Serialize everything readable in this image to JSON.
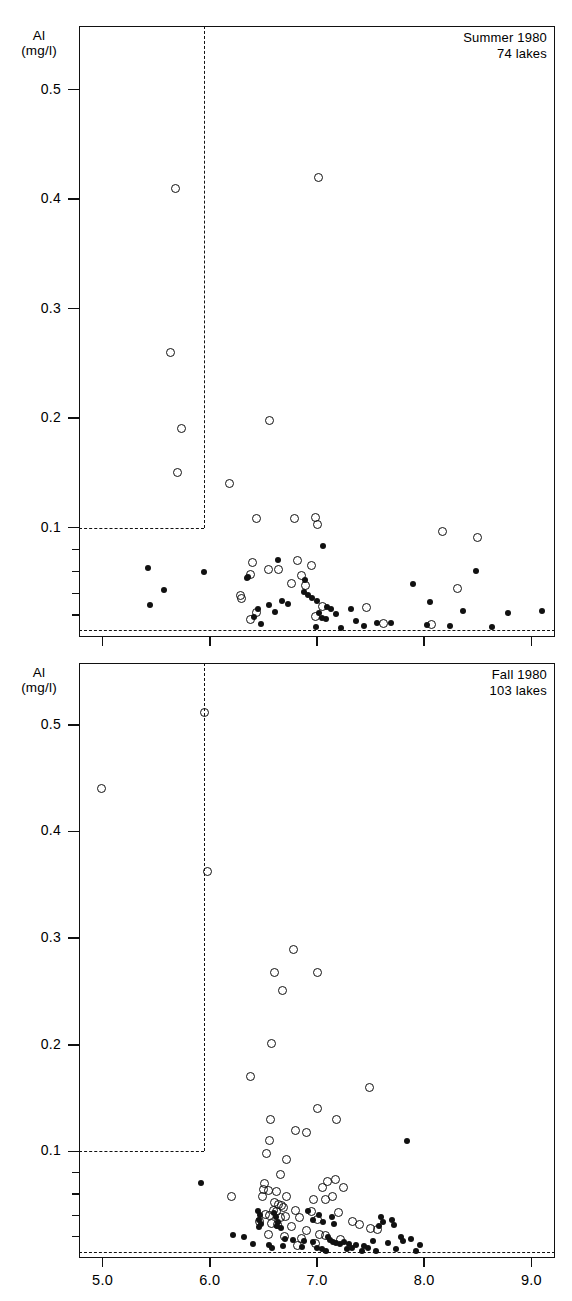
{
  "figure": {
    "background": "#ffffff",
    "ink_color": "#111111",
    "width": 572,
    "height": 1301
  },
  "chart_data": [
    {
      "type": "scatter",
      "title": "Summer 1980",
      "subtitle": "74 lakes",
      "panel_id": "summer",
      "xlabel": "",
      "ylabel": "Al",
      "ylabel_units": "(mg/l)",
      "xlim": [
        4.78,
        9.22
      ],
      "ylim": [
        0.0,
        0.558
      ],
      "xticks": [
        5.0,
        6.0,
        7.0,
        8.0,
        9.0
      ],
      "xticklabels": [
        "5.0",
        "6.0",
        "7.0",
        "8.0",
        "9.0"
      ],
      "xticklabels_visible": false,
      "yticks": [
        0.1,
        0.2,
        0.3,
        0.4,
        0.5
      ],
      "yticklabels": [
        "0.1",
        "0.2",
        "0.3",
        "0.4",
        "0.5"
      ],
      "yticks_minor": [
        0.02,
        0.04,
        0.06,
        0.08
      ],
      "grid": false,
      "legend": "none",
      "annotations": [
        {
          "name": "threshold-box",
          "style": "dashed",
          "x_vertical": 5.95,
          "y_horizontal": 0.1
        },
        {
          "name": "detection-limit-line",
          "style": "dashed",
          "y": 0.006
        }
      ],
      "series": [
        {
          "name": "open-circle",
          "marker": "open circle",
          "points": [
            [
              5.68,
              0.41
            ],
            [
              7.01,
              0.42
            ],
            [
              5.63,
              0.26
            ],
            [
              5.74,
              0.19
            ],
            [
              5.7,
              0.15
            ],
            [
              6.18,
              0.14
            ],
            [
              6.56,
              0.198
            ],
            [
              6.44,
              0.108
            ],
            [
              6.79,
              0.108
            ],
            [
              6.99,
              0.109
            ],
            [
              7.0,
              0.103
            ],
            [
              8.17,
              0.096
            ],
            [
              8.5,
              0.091
            ],
            [
              6.4,
              0.068
            ],
            [
              6.82,
              0.07
            ],
            [
              6.95,
              0.065
            ],
            [
              6.55,
              0.062
            ],
            [
              6.64,
              0.062
            ],
            [
              6.38,
              0.057
            ],
            [
              6.86,
              0.056
            ],
            [
              6.76,
              0.049
            ],
            [
              6.89,
              0.047
            ],
            [
              8.31,
              0.044
            ],
            [
              6.29,
              0.038
            ],
            [
              6.3,
              0.035
            ],
            [
              7.05,
              0.028
            ],
            [
              7.46,
              0.027
            ],
            [
              6.44,
              0.022
            ],
            [
              6.99,
              0.019
            ],
            [
              7.62,
              0.012
            ],
            [
              8.07,
              0.011
            ],
            [
              6.38,
              0.016
            ]
          ]
        },
        {
          "name": "filled-dot",
          "marker": "filled dot",
          "points": [
            [
              5.42,
              0.063
            ],
            [
              5.95,
              0.059
            ],
            [
              8.48,
              0.06
            ],
            [
              7.06,
              0.083
            ],
            [
              6.64,
              0.07
            ],
            [
              6.35,
              0.054
            ],
            [
              6.36,
              0.055
            ],
            [
              6.89,
              0.052
            ],
            [
              7.9,
              0.048
            ],
            [
              5.57,
              0.043
            ],
            [
              6.88,
              0.041
            ],
            [
              6.92,
              0.038
            ],
            [
              6.95,
              0.036
            ],
            [
              7.0,
              0.033
            ],
            [
              6.67,
              0.033
            ],
            [
              6.73,
              0.03
            ],
            [
              8.05,
              0.032
            ],
            [
              5.44,
              0.029
            ],
            [
              6.45,
              0.026
            ],
            [
              6.55,
              0.029
            ],
            [
              7.09,
              0.027
            ],
            [
              7.13,
              0.026
            ],
            [
              7.32,
              0.026
            ],
            [
              8.36,
              0.024
            ],
            [
              8.78,
              0.022
            ],
            [
              9.1,
              0.024
            ],
            [
              6.61,
              0.023
            ],
            [
              7.02,
              0.022
            ],
            [
              7.18,
              0.021
            ],
            [
              7.05,
              0.017
            ],
            [
              7.08,
              0.016
            ],
            [
              6.41,
              0.018
            ],
            [
              7.36,
              0.015
            ],
            [
              7.56,
              0.013
            ],
            [
              7.69,
              0.013
            ],
            [
              8.03,
              0.011
            ],
            [
              8.24,
              0.01
            ],
            [
              6.99,
              0.009
            ],
            [
              7.22,
              0.008
            ],
            [
              8.63,
              0.009
            ],
            [
              7.44,
              0.01
            ],
            [
              6.48,
              0.012
            ]
          ]
        }
      ]
    },
    {
      "type": "scatter",
      "title": "Fall 1980",
      "subtitle": "103 lakes",
      "panel_id": "fall",
      "xlabel": "",
      "ylabel": "Al",
      "ylabel_units": "(mg/l)",
      "xlim": [
        4.78,
        9.22
      ],
      "ylim": [
        0.0,
        0.558
      ],
      "xticks": [
        5.0,
        6.0,
        7.0,
        8.0,
        9.0
      ],
      "xticklabels": [
        "5.0",
        "6.0",
        "7.0",
        "8.0",
        "9.0"
      ],
      "xticklabels_visible": true,
      "yticks": [
        0.1,
        0.2,
        0.3,
        0.4,
        0.5
      ],
      "yticklabels": [
        "0.1",
        "0.2",
        "0.3",
        "0.4",
        "0.5"
      ],
      "yticks_minor": [
        0.02,
        0.04,
        0.06,
        0.08
      ],
      "grid": false,
      "legend": "none",
      "annotations": [
        {
          "name": "threshold-box",
          "style": "dashed",
          "x_vertical": 5.95,
          "y_horizontal": 0.1
        },
        {
          "name": "detection-limit-line",
          "style": "dashed",
          "y": 0.006
        }
      ],
      "series": [
        {
          "name": "open-circle",
          "marker": "open circle",
          "points": [
            [
              5.95,
              0.512
            ],
            [
              4.99,
              0.44
            ],
            [
              5.98,
              0.362
            ],
            [
              6.78,
              0.289
            ],
            [
              6.6,
              0.268
            ],
            [
              7.0,
              0.268
            ],
            [
              6.68,
              0.251
            ],
            [
              6.58,
              0.201
            ],
            [
              6.38,
              0.17
            ],
            [
              7.49,
              0.16
            ],
            [
              7.0,
              0.14
            ],
            [
              6.57,
              0.13
            ],
            [
              7.18,
              0.13
            ],
            [
              6.8,
              0.12
            ],
            [
              6.9,
              0.118
            ],
            [
              6.56,
              0.11
            ],
            [
              6.53,
              0.098
            ],
            [
              6.72,
              0.092
            ],
            [
              6.66,
              0.078
            ],
            [
              6.51,
              0.07
            ],
            [
              7.1,
              0.072
            ],
            [
              7.17,
              0.074
            ],
            [
              6.5,
              0.064
            ],
            [
              6.55,
              0.063
            ],
            [
              7.05,
              0.066
            ],
            [
              7.25,
              0.066
            ],
            [
              6.62,
              0.062
            ],
            [
              6.49,
              0.058
            ],
            [
              6.72,
              0.058
            ],
            [
              6.2,
              0.058
            ],
            [
              7.14,
              0.058
            ],
            [
              6.97,
              0.055
            ],
            [
              7.08,
              0.055
            ],
            [
              6.6,
              0.052
            ],
            [
              6.64,
              0.05
            ],
            [
              6.67,
              0.049
            ],
            [
              6.69,
              0.047
            ],
            [
              6.59,
              0.045
            ],
            [
              6.62,
              0.044
            ],
            [
              6.8,
              0.045
            ],
            [
              6.95,
              0.044
            ],
            [
              7.2,
              0.043
            ],
            [
              6.52,
              0.041
            ],
            [
              6.56,
              0.04
            ],
            [
              6.66,
              0.038
            ],
            [
              6.71,
              0.039
            ],
            [
              6.84,
              0.038
            ],
            [
              7.0,
              0.036
            ],
            [
              7.33,
              0.034
            ],
            [
              7.4,
              0.031
            ],
            [
              6.46,
              0.034
            ],
            [
              6.58,
              0.032
            ],
            [
              6.63,
              0.031
            ],
            [
              6.76,
              0.03
            ],
            [
              7.5,
              0.028
            ],
            [
              7.56,
              0.027
            ],
            [
              6.9,
              0.026
            ],
            [
              7.02,
              0.022
            ],
            [
              7.08,
              0.021
            ],
            [
              6.86,
              0.018
            ],
            [
              6.7,
              0.02
            ],
            [
              6.55,
              0.022
            ],
            [
              7.22,
              0.017
            ],
            [
              6.99,
              0.014
            ],
            [
              6.82,
              0.012
            ]
          ]
        },
        {
          "name": "filled-dot",
          "marker": "filled dot",
          "points": [
            [
              5.92,
              0.07
            ],
            [
              7.84,
              0.11
            ],
            [
              6.45,
              0.044
            ],
            [
              6.47,
              0.04
            ],
            [
              6.46,
              0.036
            ],
            [
              6.48,
              0.032
            ],
            [
              6.46,
              0.029
            ],
            [
              6.6,
              0.042
            ],
            [
              6.62,
              0.038
            ],
            [
              6.64,
              0.034
            ],
            [
              6.63,
              0.03
            ],
            [
              6.66,
              0.028
            ],
            [
              6.92,
              0.044
            ],
            [
              7.02,
              0.04
            ],
            [
              6.96,
              0.036
            ],
            [
              7.06,
              0.034
            ],
            [
              7.14,
              0.038
            ],
            [
              7.16,
              0.032
            ],
            [
              7.6,
              0.038
            ],
            [
              7.62,
              0.034
            ],
            [
              7.58,
              0.03
            ],
            [
              7.7,
              0.036
            ],
            [
              7.72,
              0.031
            ],
            [
              6.22,
              0.022
            ],
            [
              6.32,
              0.02
            ],
            [
              6.7,
              0.018
            ],
            [
              6.78,
              0.017
            ],
            [
              6.88,
              0.016
            ],
            [
              6.96,
              0.015
            ],
            [
              7.1,
              0.02
            ],
            [
              7.12,
              0.017
            ],
            [
              7.15,
              0.015
            ],
            [
              7.18,
              0.014
            ],
            [
              7.21,
              0.013
            ],
            [
              7.25,
              0.015
            ],
            [
              7.3,
              0.013
            ],
            [
              7.36,
              0.012
            ],
            [
              7.44,
              0.011
            ],
            [
              7.52,
              0.016
            ],
            [
              7.66,
              0.014
            ],
            [
              7.78,
              0.02
            ],
            [
              7.8,
              0.016
            ],
            [
              7.88,
              0.018
            ],
            [
              7.96,
              0.012
            ],
            [
              6.86,
              0.01
            ],
            [
              7.0,
              0.009
            ],
            [
              7.05,
              0.008
            ],
            [
              7.08,
              0.007
            ],
            [
              7.28,
              0.008
            ],
            [
              7.42,
              0.007
            ],
            [
              7.55,
              0.007
            ],
            [
              7.74,
              0.008
            ],
            [
              7.92,
              0.007
            ],
            [
              6.55,
              0.012
            ],
            [
              6.58,
              0.009
            ],
            [
              6.68,
              0.011
            ],
            [
              7.33,
              0.009
            ],
            [
              7.48,
              0.009
            ],
            [
              6.4,
              0.013
            ]
          ]
        }
      ]
    }
  ]
}
